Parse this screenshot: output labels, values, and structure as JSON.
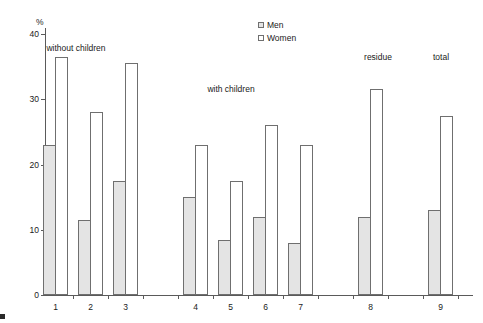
{
  "chart_data": {
    "type": "bar",
    "title": "",
    "xlabel": "",
    "ylabel": "%",
    "ylim": [
      0,
      40
    ],
    "yticks": [
      0,
      10,
      20,
      30,
      40
    ],
    "grid": false,
    "legend_position": "top-center",
    "categories": [
      "1",
      "2",
      "3",
      "4",
      "5",
      "6",
      "7",
      "8",
      "9"
    ],
    "series": [
      {
        "name": "Men",
        "fill": "#e4e4e4",
        "values": [
          23,
          11.5,
          17.5,
          15,
          8.5,
          12,
          8,
          12,
          13
        ]
      },
      {
        "name": "Women",
        "fill": "#ffffff",
        "values": [
          36.5,
          28,
          35.5,
          23,
          17.5,
          26,
          23,
          31.5,
          27.5
        ]
      }
    ],
    "group_labels": [
      {
        "text": "without children",
        "x": 76,
        "y": 43
      },
      {
        "text": "with children",
        "x": 231,
        "y": 84
      },
      {
        "text": "residue",
        "x": 378,
        "y": 52
      },
      {
        "text": "total",
        "x": 441,
        "y": 52
      }
    ]
  },
  "legend": {
    "items": [
      {
        "label": "Men",
        "fill": "#e4e4e4"
      },
      {
        "label": "Women",
        "fill": "#ffffff"
      }
    ]
  },
  "axis": {
    "percent_label": "%"
  },
  "colors": {
    "outline": "#6f6f6f",
    "axis": "#5a5a5a",
    "men_fill": "#e4e4e4",
    "women_fill": "#ffffff"
  }
}
